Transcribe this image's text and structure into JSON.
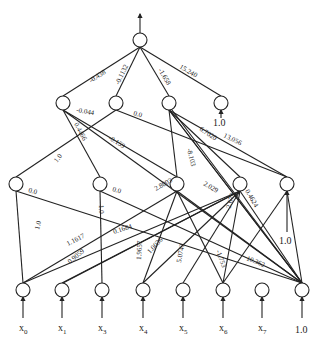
{
  "diagram": {
    "type": "neural-network",
    "output_arrow": true,
    "nodes": {
      "output": {
        "x": 140,
        "y": 40
      },
      "layer2": [
        {
          "id": "h2_0",
          "x": 63,
          "y": 103
        },
        {
          "id": "h2_1",
          "x": 116,
          "y": 103
        },
        {
          "id": "h2_2",
          "x": 169,
          "y": 103
        },
        {
          "id": "h2_bias",
          "x": 221,
          "y": 103,
          "bias_label": "1.0"
        }
      ],
      "layer1": [
        {
          "id": "h1_0",
          "x": 16,
          "y": 184
        },
        {
          "id": "h1_1",
          "x": 100,
          "y": 184
        },
        {
          "id": "h1_2",
          "x": 177,
          "y": 184
        },
        {
          "id": "h1_3",
          "x": 240,
          "y": 184
        },
        {
          "id": "h1_bias",
          "x": 287,
          "y": 184,
          "bias_label": "1.0"
        }
      ],
      "inputs": [
        {
          "id": "x0",
          "x": 23,
          "y": 290,
          "label": "x",
          "sub": "0"
        },
        {
          "id": "x1",
          "x": 62,
          "y": 290,
          "label": "x",
          "sub": "1"
        },
        {
          "id": "x3",
          "x": 102,
          "y": 290,
          "label": "x",
          "sub": "3"
        },
        {
          "id": "x4",
          "x": 143,
          "y": 290,
          "label": "x",
          "sub": "4"
        },
        {
          "id": "x5",
          "x": 183,
          "y": 290,
          "label": "x",
          "sub": "5"
        },
        {
          "id": "x6",
          "x": 223,
          "y": 290,
          "label": "x",
          "sub": "6"
        },
        {
          "id": "x7",
          "x": 262,
          "y": 290,
          "label": "x",
          "sub": "7"
        },
        {
          "id": "bias_in",
          "x": 302,
          "y": 290,
          "label": "1.0",
          "sub": ""
        }
      ]
    },
    "edges": [
      {
        "from": "h2_0",
        "to": "output",
        "weight": "-0.438"
      },
      {
        "from": "h2_1",
        "to": "output",
        "weight": "-0.1132"
      },
      {
        "from": "h2_2",
        "to": "output",
        "weight": "-1.658"
      },
      {
        "from": "h2_bias",
        "to": "output",
        "weight": "15.240"
      },
      {
        "from": "h1_bias",
        "to": "h2_0",
        "weight": "-0.044"
      },
      {
        "from": "h1_3",
        "to": "h2_0",
        "weight": "0.4466"
      },
      {
        "from": "h1_2",
        "to": "h2_0",
        "weight": "-0.159"
      },
      {
        "from": "h1_0",
        "to": "h2_1",
        "weight": "1.0"
      },
      {
        "from": "h1_bias",
        "to": "h2_1",
        "weight": "0.0"
      },
      {
        "from": "h1_1",
        "to": "h2_2",
        "weight": "-8.103"
      },
      {
        "from": "h1_2",
        "to": "h2_2",
        "weight": "6.7020"
      },
      {
        "from": "h1_bias",
        "to": "h2_2",
        "weight": "13.056"
      },
      {
        "from": "x0",
        "to": "h1_0",
        "weight": "1.0"
      },
      {
        "from": "bias_in",
        "to": "h1_0",
        "weight": "0.0"
      },
      {
        "from": "x3",
        "to": "h1_1",
        "weight": "1.0"
      },
      {
        "from": "bias_in",
        "to": "h1_1",
        "weight": "0.0"
      },
      {
        "from": "x0",
        "to": "h1_2",
        "weight": "1.1617"
      },
      {
        "from": "x4",
        "to": "h1_2",
        "weight": "1.9657"
      },
      {
        "from": "bias_in",
        "to": "h1_2",
        "weight": "2.8003"
      },
      {
        "from": "x0",
        "to": "h1_3",
        "weight": "0.1684"
      },
      {
        "from": "x4",
        "to": "h1_3",
        "weight": "1.0036"
      },
      {
        "from": "x5",
        "to": "h1_3",
        "weight": "5.0743"
      },
      {
        "from": "bias_in",
        "to": "h1_3",
        "weight": "2.029"
      },
      {
        "from": "x0",
        "to": "h1_3b",
        "weight": "0.9059"
      },
      {
        "from": "x6",
        "to": "h1_3c",
        "weight": "-1.753"
      },
      {
        "from": "x6",
        "to": "h1_4w",
        "weight": "-2.673"
      },
      {
        "from": "bias_in",
        "to": "h1_4w",
        "weight": "0.4624"
      },
      {
        "from": "x7",
        "to": "bias",
        "weight": "10.362"
      }
    ]
  }
}
